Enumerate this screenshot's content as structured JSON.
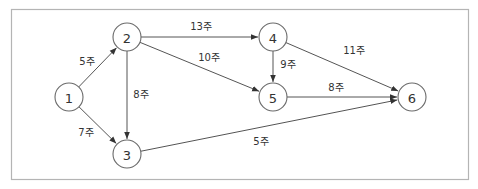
{
  "diagram": {
    "type": "directed-network (activity-on-arrow)",
    "colors": {
      "frame": "#b4b4b4",
      "edge": "#555555",
      "node_stroke": "#6a6a6a",
      "text": "#333333"
    },
    "nodes": [
      {
        "id": "1",
        "label": "1",
        "x": 69,
        "y": 97,
        "r": 14
      },
      {
        "id": "2",
        "label": "2",
        "x": 127,
        "y": 37,
        "r": 14
      },
      {
        "id": "3",
        "label": "3",
        "x": 127,
        "y": 154,
        "r": 14
      },
      {
        "id": "4",
        "label": "4",
        "x": 273,
        "y": 37,
        "r": 14
      },
      {
        "id": "5",
        "label": "5",
        "x": 273,
        "y": 97,
        "r": 14
      },
      {
        "id": "6",
        "label": "6",
        "x": 412,
        "y": 97,
        "r": 14
      }
    ],
    "edges": [
      {
        "from": "1",
        "to": "2",
        "label": "5주",
        "lx": 87,
        "ly": 61
      },
      {
        "from": "1",
        "to": "3",
        "label": "7주",
        "lx": 86,
        "ly": 132
      },
      {
        "from": "2",
        "to": "3",
        "label": "8주",
        "lx": 141,
        "ly": 94
      },
      {
        "from": "2",
        "to": "4",
        "label": "13주",
        "lx": 201,
        "ly": 26
      },
      {
        "from": "2",
        "to": "5",
        "label": "10주",
        "lx": 209,
        "ly": 57
      },
      {
        "from": "4",
        "to": "5",
        "label": "9주",
        "lx": 288,
        "ly": 64
      },
      {
        "from": "4",
        "to": "6",
        "label": "11주",
        "lx": 354,
        "ly": 50
      },
      {
        "from": "5",
        "to": "6",
        "label": "8주",
        "lx": 336,
        "ly": 87
      },
      {
        "from": "3",
        "to": "6",
        "label": "5주",
        "lx": 261,
        "ly": 141
      }
    ]
  }
}
